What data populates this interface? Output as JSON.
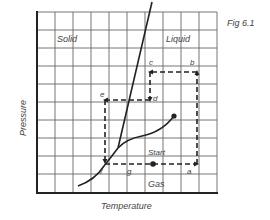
{
  "figure": {
    "caption": "Fig 6.1",
    "x_axis_label": "Temperature",
    "y_axis_label": "Pressure"
  },
  "regions": {
    "solid": "Solid",
    "liquid": "Liquid",
    "gas": "Gas"
  },
  "points": {
    "a": "a",
    "b": "b",
    "c": "c",
    "d": "d",
    "e": "e",
    "f": "f",
    "g": "g",
    "start": "Start"
  },
  "colors": {
    "grid": "#555555",
    "curve": "#222222",
    "path": "#222222",
    "text": "#444444"
  }
}
